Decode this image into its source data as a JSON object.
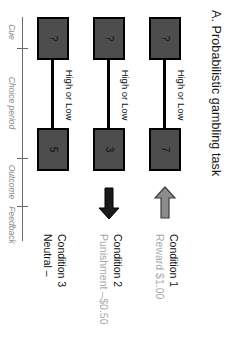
{
  "figure": {
    "title": "A. Probabilistic gambling task"
  },
  "trials": [
    {
      "cue": "?",
      "choice_label": "High or Low",
      "outcome": "7",
      "feedback_icon": "left-arrow-icon",
      "feedback_color": "#8c8c8c",
      "condition_name": "Condition 1",
      "condition_detail": "Reward $1.00",
      "detail_color": "#a8a8a8"
    },
    {
      "cue": "?",
      "choice_label": "High or Low",
      "outcome": "3",
      "feedback_icon": "right-arrow-icon",
      "feedback_color": "#1a1a1a",
      "condition_name": "Condition 2",
      "condition_detail": "Punishment –$0.50",
      "detail_color": "#a8a8a8"
    },
    {
      "cue": "?",
      "choice_label": "High or Low",
      "outcome": "5",
      "feedback_icon": "neutral-dash-icon",
      "feedback_color": "#1a1a1a",
      "condition_name": "Condition 3",
      "condition_detail": "Neutral –",
      "detail_color": "#111111"
    }
  ],
  "timeline": {
    "labels": [
      "Cue",
      "Choice period",
      "Outcome",
      "Feedback"
    ]
  },
  "colors": {
    "box_fill": "#4d4d4d",
    "box_stroke": "#000000",
    "axis": "#6b6b6b",
    "muted_text": "#a8a8a8"
  }
}
